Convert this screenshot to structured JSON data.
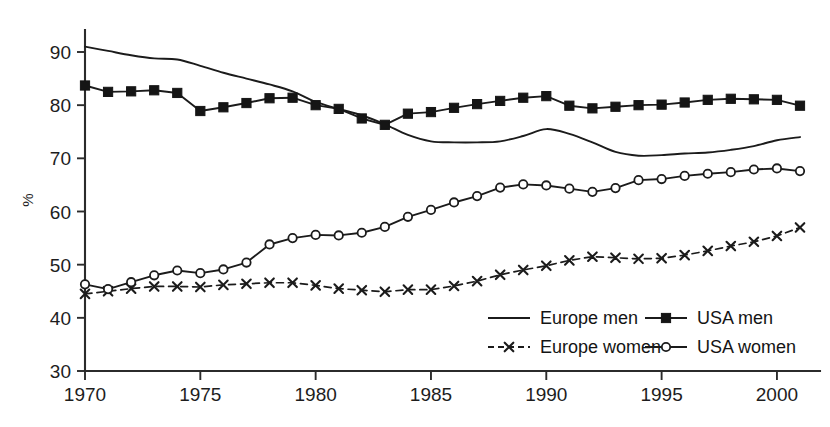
{
  "chart_data": {
    "type": "line",
    "title": "",
    "subtitle": "",
    "xlabel": "",
    "ylabel": "%",
    "xlim": [
      1970,
      2001
    ],
    "ylim": [
      30,
      92
    ],
    "grid": false,
    "legend_position": "bottom-right",
    "x_ticks": [
      1970,
      1975,
      1980,
      1985,
      1990,
      1995,
      2000
    ],
    "x_tick_labels": [
      "1970",
      "1975",
      "1980",
      "1985",
      "1990",
      "1995",
      "2000"
    ],
    "y_ticks": [
      30,
      40,
      50,
      60,
      70,
      80,
      90
    ],
    "y_tick_labels": [
      "30",
      "40",
      "50",
      "60",
      "70",
      "80",
      "90"
    ],
    "x": [
      1970,
      1971,
      1972,
      1973,
      1974,
      1975,
      1976,
      1977,
      1978,
      1979,
      1980,
      1981,
      1982,
      1983,
      1984,
      1985,
      1986,
      1987,
      1988,
      1989,
      1990,
      1991,
      1992,
      1993,
      1994,
      1995,
      1996,
      1997,
      1998,
      1999,
      2000,
      2001
    ],
    "series": [
      {
        "name": "Europe men",
        "marker": "none",
        "dash": false,
        "values": [
          91.0,
          90.2,
          89.4,
          88.8,
          88.6,
          87.4,
          86.1,
          85.0,
          83.9,
          82.6,
          80.6,
          79.3,
          78.1,
          76.4,
          74.4,
          73.2,
          73.0,
          73.0,
          73.2,
          74.2,
          75.5,
          74.6,
          73.0,
          71.2,
          70.5,
          70.6,
          70.9,
          71.1,
          71.6,
          72.3,
          73.4,
          74.0
        ]
      },
      {
        "name": "USA men",
        "marker": "square",
        "dash": false,
        "values": [
          83.7,
          82.5,
          82.6,
          82.8,
          82.3,
          78.9,
          79.6,
          80.4,
          81.3,
          81.4,
          80.0,
          79.3,
          77.5,
          76.3,
          78.4,
          78.7,
          79.5,
          80.2,
          80.8,
          81.4,
          81.7,
          79.9,
          79.4,
          79.7,
          80.0,
          80.1,
          80.5,
          81.0,
          81.2,
          81.1,
          81.0,
          79.9
        ]
      },
      {
        "name": "Europe women",
        "marker": "x",
        "dash": true,
        "values": [
          44.5,
          45.0,
          45.5,
          45.9,
          45.9,
          45.8,
          46.2,
          46.4,
          46.6,
          46.6,
          46.1,
          45.5,
          45.2,
          44.9,
          45.3,
          45.3,
          46.0,
          46.9,
          48.1,
          49.0,
          49.8,
          50.8,
          51.5,
          51.3,
          51.1,
          51.2,
          51.8,
          52.6,
          53.5,
          54.3,
          55.4,
          57.0
        ]
      },
      {
        "name": "USA women",
        "marker": "circle",
        "dash": false,
        "values": [
          46.3,
          45.4,
          46.7,
          48.0,
          48.9,
          48.4,
          49.1,
          50.4,
          53.8,
          55.0,
          55.6,
          55.5,
          56.0,
          57.1,
          59.0,
          60.3,
          61.7,
          62.9,
          64.5,
          65.1,
          64.9,
          64.3,
          63.7,
          64.4,
          65.9,
          66.1,
          66.7,
          67.1,
          67.4,
          67.9,
          68.1,
          67.6
        ]
      }
    ]
  },
  "legend": {
    "entries": [
      {
        "label": "Europe men",
        "marker": "none",
        "dash": false
      },
      {
        "label": "USA men",
        "marker": "square",
        "dash": false
      },
      {
        "label": "Europe women",
        "marker": "x",
        "dash": true
      },
      {
        "label": "USA women",
        "marker": "circle",
        "dash": false
      }
    ]
  }
}
